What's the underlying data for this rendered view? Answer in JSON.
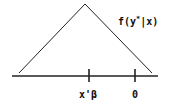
{
  "diagram": {
    "density_label": "f(y*|x)",
    "density_label_parts": {
      "prefix": "f(y",
      "superscript": "*",
      "suffix": "|x)"
    },
    "axis_ticks": [
      {
        "label": "x'β",
        "x": 89
      },
      {
        "label": "0",
        "x": 135
      }
    ],
    "shape": "triangle",
    "colors": {
      "line": "#222222",
      "background": "#ffffff"
    }
  }
}
